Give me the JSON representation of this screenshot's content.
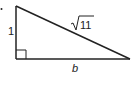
{
  "diagram": {
    "type": "right-triangle",
    "colors": {
      "stroke": "#222222",
      "background": "#ffffff"
    },
    "vertices": {
      "top": [
        16,
        6
      ],
      "right_angle": [
        16,
        59
      ],
      "right": [
        130,
        59
      ]
    },
    "labels": {
      "vertical_leg": "1",
      "hypotenuse_radicand": "11",
      "hypotenuse_symbol": "√",
      "base": "b"
    },
    "right_angle_marker": true
  }
}
